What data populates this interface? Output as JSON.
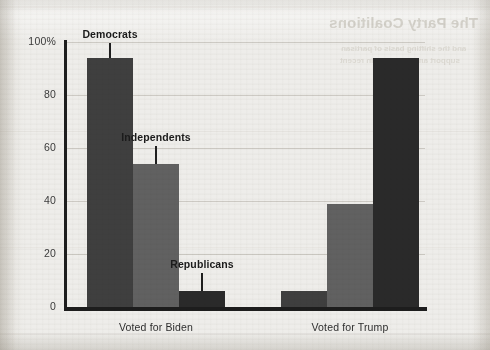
{
  "page": {
    "background_color": "#eeedea",
    "showthrough": {
      "title": "The Party Coalitions",
      "line1": "and the shifting basis of partisan",
      "line2": "support among voters in recent"
    }
  },
  "chart_data": {
    "type": "bar",
    "title": "",
    "xlabel": "",
    "ylabel": "",
    "ylim": [
      0,
      100
    ],
    "grid": true,
    "legend": "inline-callouts",
    "categories": [
      "Voted for Biden",
      "Voted for Trump"
    ],
    "y_ticks": [
      {
        "value": 0,
        "label": "0"
      },
      {
        "value": 20,
        "label": "20"
      },
      {
        "value": 40,
        "label": "40"
      },
      {
        "value": 60,
        "label": "60"
      },
      {
        "value": 80,
        "label": "80"
      },
      {
        "value": 100,
        "label": "100%"
      }
    ],
    "series": [
      {
        "name": "Democrats",
        "color": "#3f3f3f",
        "values": [
          94,
          6
        ]
      },
      {
        "name": "Independents",
        "color": "#616161",
        "values": [
          54,
          39
        ]
      },
      {
        "name": "Republicans",
        "color": "#2a2a2a",
        "values": [
          6,
          94
        ]
      }
    ],
    "annotations": [
      {
        "label": "Democrats",
        "target_group": "Voted for Biden",
        "target_series": "Democrats"
      },
      {
        "label": "Independents",
        "target_group": "Voted for Biden",
        "target_series": "Independents"
      },
      {
        "label": "Republicans",
        "target_group": "Voted for Biden",
        "target_series": "Republicans"
      }
    ],
    "axis_color": "#1d1d1d"
  }
}
